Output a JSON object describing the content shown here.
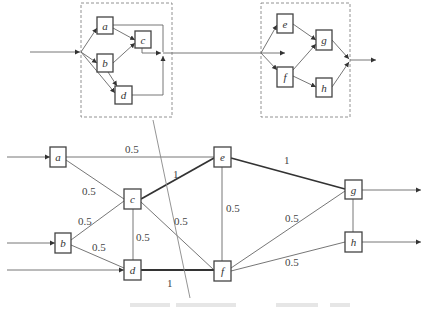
{
  "top_diagram": {
    "left_group": {
      "nodes": [
        {
          "id": "a",
          "label": "a"
        },
        {
          "id": "b",
          "label": "b"
        },
        {
          "id": "c",
          "label": "c"
        },
        {
          "id": "d",
          "label": "d"
        }
      ],
      "edges": [
        [
          "in",
          "a"
        ],
        [
          "in",
          "b"
        ],
        [
          "in",
          "d"
        ],
        [
          "a",
          "c"
        ],
        [
          "b",
          "c"
        ],
        [
          "b",
          "d"
        ],
        [
          "a",
          "out"
        ],
        [
          "c",
          "out"
        ],
        [
          "d",
          "out"
        ]
      ]
    },
    "right_group": {
      "nodes": [
        {
          "id": "e",
          "label": "e"
        },
        {
          "id": "f",
          "label": "f"
        },
        {
          "id": "g",
          "label": "g"
        },
        {
          "id": "h",
          "label": "h"
        }
      ],
      "edges": [
        [
          "in",
          "e"
        ],
        [
          "in",
          "f"
        ],
        [
          "e",
          "g"
        ],
        [
          "f",
          "g"
        ],
        [
          "f",
          "h"
        ],
        [
          "g",
          "out"
        ],
        [
          "h",
          "out"
        ]
      ]
    }
  },
  "bottom_diagram": {
    "nodes": [
      {
        "id": "a",
        "label": "a"
      },
      {
        "id": "b",
        "label": "b"
      },
      {
        "id": "c",
        "label": "c"
      },
      {
        "id": "d",
        "label": "d"
      },
      {
        "id": "e",
        "label": "e"
      },
      {
        "id": "f",
        "label": "f"
      },
      {
        "id": "g",
        "label": "g"
      },
      {
        "id": "h",
        "label": "h"
      }
    ],
    "edges": [
      {
        "from": "a",
        "to": "e",
        "weight": "0.5"
      },
      {
        "from": "a",
        "to": "c",
        "weight": "0.5"
      },
      {
        "from": "b",
        "to": "c",
        "weight": "0.5"
      },
      {
        "from": "b",
        "to": "d",
        "weight": "0.5"
      },
      {
        "from": "c",
        "to": "e",
        "weight": "1"
      },
      {
        "from": "c",
        "to": "d",
        "weight": "0.5"
      },
      {
        "from": "c",
        "to": "f",
        "weight": "0.5"
      },
      {
        "from": "d",
        "to": "f",
        "weight": "1"
      },
      {
        "from": "e",
        "to": "f",
        "weight": "0.5"
      },
      {
        "from": "e",
        "to": "g",
        "weight": "1"
      },
      {
        "from": "f",
        "to": "g",
        "weight": "0.5"
      },
      {
        "from": "f",
        "to": "h",
        "weight": "0.5"
      },
      {
        "from": "g",
        "to": "h",
        "weight": ""
      }
    ],
    "weights": {
      "a_e": "0.5",
      "a_c": "0.5",
      "b_c": "0.5",
      "b_d": "0.5",
      "c_e": "1",
      "c_d": "0.5",
      "c_f": "0.5",
      "d_f": "1",
      "e_f": "0.5",
      "e_g": "1",
      "f_g": "0.5",
      "f_h": "0.5"
    }
  },
  "caption": {
    "legible": false
  }
}
